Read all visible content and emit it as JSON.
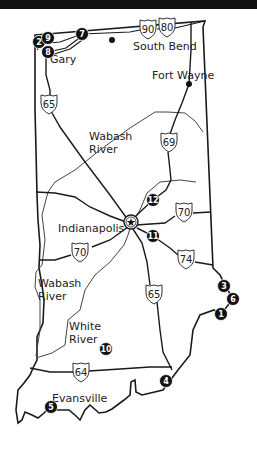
{
  "header": {
    "title": ""
  },
  "map": {
    "region": "Indiana",
    "colors": {
      "line": "#1a1a1a",
      "river": "#444444",
      "marker_fill": "#111111",
      "marker_text": "#ffffff",
      "background": "#ffffff"
    },
    "cities": [
      {
        "name": "South Bend",
        "x": 133,
        "y": 50,
        "dot": true,
        "dot_x": 112,
        "dot_y": 40
      },
      {
        "name": "Gary",
        "x": 50,
        "y": 63,
        "dot": false
      },
      {
        "name": "Fort Wayne",
        "x": 152,
        "y": 79,
        "dot": true,
        "dot_x": 189,
        "dot_y": 84
      },
      {
        "name": "Indianapolis",
        "x": 58,
        "y": 232,
        "dot": false
      },
      {
        "name": "Evansville",
        "x": 52,
        "y": 402,
        "dot": false
      }
    ],
    "capital": {
      "name": "Indianapolis",
      "icon": "star-icon",
      "x": 131,
      "y": 222
    },
    "rivers": [
      {
        "name_line1": "Wabash",
        "name_line2": "River",
        "x": 89,
        "y": 140
      },
      {
        "name_line1": "Wabash",
        "name_line2": "River",
        "x": 38,
        "y": 287
      },
      {
        "name_line1": "White",
        "name_line2": "River",
        "x": 69,
        "y": 330
      }
    ],
    "interstates": [
      {
        "number": "90",
        "x": 148,
        "y": 29
      },
      {
        "number": "80",
        "x": 167,
        "y": 27
      },
      {
        "number": "65",
        "x": 49,
        "y": 104
      },
      {
        "number": "69",
        "x": 169,
        "y": 142
      },
      {
        "number": "70",
        "x": 184,
        "y": 212
      },
      {
        "number": "70",
        "x": 80,
        "y": 252
      },
      {
        "number": "74",
        "x": 186,
        "y": 259
      },
      {
        "number": "65",
        "x": 154,
        "y": 294
      },
      {
        "number": "64",
        "x": 81,
        "y": 372
      }
    ],
    "markers": [
      {
        "number": "1",
        "x": 221,
        "y": 314
      },
      {
        "number": "2",
        "x": 39,
        "y": 42
      },
      {
        "number": "3",
        "x": 224,
        "y": 286
      },
      {
        "number": "4",
        "x": 166,
        "y": 381
      },
      {
        "number": "5",
        "x": 51,
        "y": 407
      },
      {
        "number": "6",
        "x": 233,
        "y": 299
      },
      {
        "number": "7",
        "x": 82,
        "y": 34
      },
      {
        "number": "8",
        "x": 48,
        "y": 52
      },
      {
        "number": "9",
        "x": 48,
        "y": 38
      },
      {
        "number": "10",
        "x": 106,
        "y": 349
      },
      {
        "number": "11",
        "x": 153,
        "y": 236
      },
      {
        "number": "12",
        "x": 153,
        "y": 200
      }
    ]
  }
}
